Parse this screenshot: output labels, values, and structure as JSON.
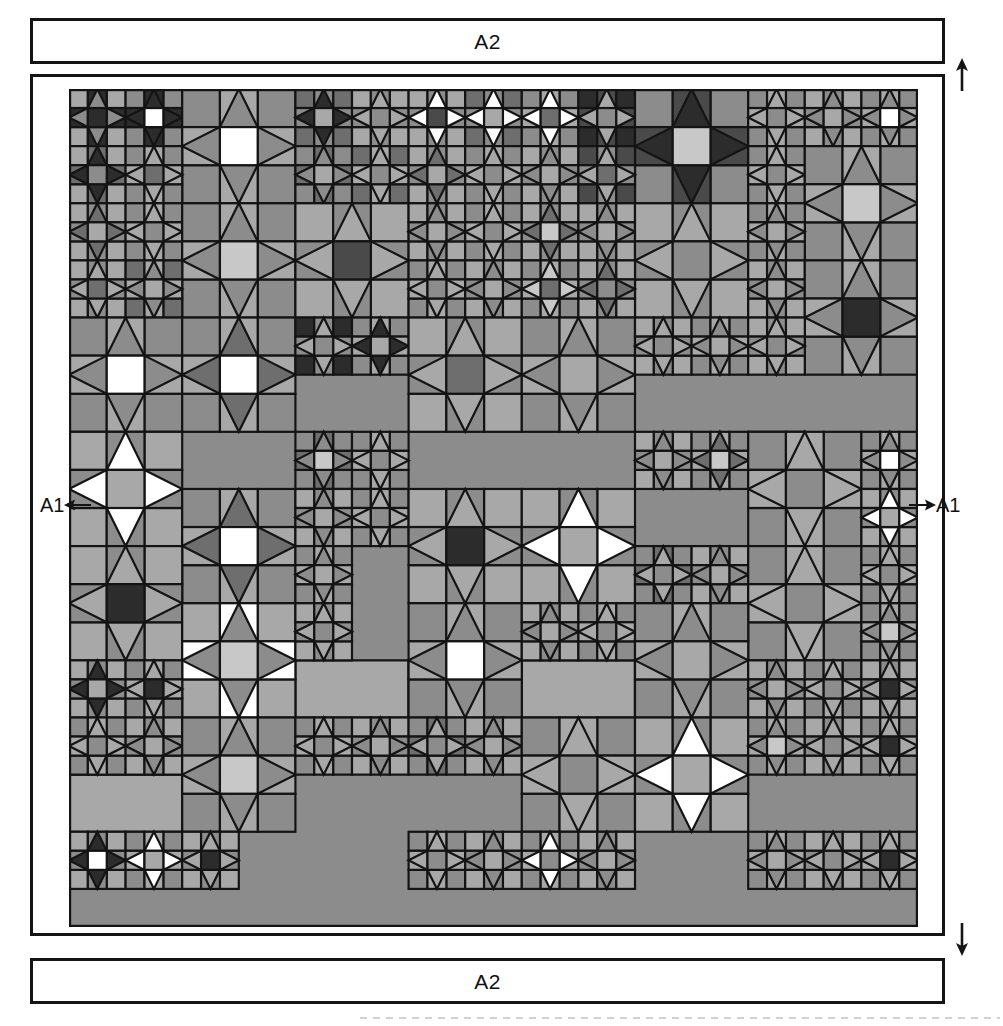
{
  "page": {
    "width": 1003,
    "height": 1026,
    "background": "#ffffff",
    "line_color": "#141414"
  },
  "border_strips": {
    "top": {
      "label": "A2"
    },
    "bottom": {
      "label": "A2"
    }
  },
  "side_markers": {
    "left": {
      "label": "A1",
      "arrow": "arrow-left-icon",
      "direction": "left"
    },
    "right": {
      "label": "A1",
      "arrow": "arrow-right-icon",
      "direction": "right"
    }
  },
  "direction_arrows": {
    "top": {
      "icon": "arrow-up-icon",
      "direction": "up"
    },
    "bottom": {
      "icon": "arrow-down-icon",
      "direction": "down"
    }
  },
  "palette": {
    "white": "#ffffff",
    "light": "#c8c8c8",
    "mid_light": "#a8a8a8",
    "mid": "#8c8c8c",
    "mid_dark": "#6e6e6e",
    "dark": "#4a4a4a",
    "darkest": "#2c2c2c",
    "outline": "#141414"
  },
  "quilt": {
    "name": "sawtooth-star-sampler",
    "unit": 19,
    "cols": 45,
    "rows": 44,
    "stroke_width": 2.2,
    "blocks": [
      {
        "x": 0,
        "y": 0,
        "n": 3,
        "center": "darkest",
        "star": "mid",
        "bg": "darkest",
        "corner": "mid_light"
      },
      {
        "x": 3,
        "y": 0,
        "n": 3,
        "center": "white",
        "star": "darkest",
        "bg": "darkest",
        "corner": "mid"
      },
      {
        "x": 6,
        "y": 0,
        "n": 6,
        "center": "white",
        "star": "mid",
        "bg": "mid_light",
        "corner": "mid"
      },
      {
        "x": 12,
        "y": 0,
        "n": 3,
        "center": "mid_light",
        "star": "darkest",
        "bg": "mid",
        "corner": "mid_dark"
      },
      {
        "x": 15,
        "y": 0,
        "n": 3,
        "center": "mid",
        "star": "mid_light",
        "bg": "mid",
        "corner": "mid_light"
      },
      {
        "x": 18,
        "y": 0,
        "n": 3,
        "center": "dark",
        "star": "white",
        "bg": "mid",
        "corner": "mid_light"
      },
      {
        "x": 21,
        "y": 0,
        "n": 3,
        "center": "mid_light",
        "star": "white",
        "bg": "mid",
        "corner": "mid_dark"
      },
      {
        "x": 24,
        "y": 0,
        "n": 3,
        "center": "mid_dark",
        "star": "white",
        "bg": "mid_light",
        "corner": "mid"
      },
      {
        "x": 27,
        "y": 0,
        "n": 3,
        "center": "mid",
        "star": "mid_light",
        "bg": "dark",
        "corner": "darkest"
      },
      {
        "x": 30,
        "y": 0,
        "n": 6,
        "center": "light",
        "star": "darkest",
        "bg": "dark",
        "corner": "mid"
      },
      {
        "x": 36,
        "y": 0,
        "n": 3,
        "center": "mid",
        "star": "mid_light",
        "bg": "mid_light",
        "corner": "mid"
      },
      {
        "x": 39,
        "y": 0,
        "n": 3,
        "center": "mid_light",
        "star": "mid",
        "bg": "mid",
        "corner": "mid_light"
      },
      {
        "x": 42,
        "y": 0,
        "n": 3,
        "center": "white",
        "star": "mid",
        "bg": "mid_light",
        "corner": "mid"
      },
      {
        "x": 0,
        "y": 3,
        "n": 3,
        "center": "mid",
        "star": "darkest",
        "bg": "mid_dark",
        "corner": "mid_light"
      },
      {
        "x": 3,
        "y": 3,
        "n": 3,
        "center": "mid_dark",
        "star": "mid_light",
        "bg": "mid_light",
        "corner": "mid"
      },
      {
        "x": 12,
        "y": 3,
        "n": 3,
        "center": "mid_light",
        "star": "mid",
        "bg": "mid_dark",
        "corner": "mid"
      },
      {
        "x": 15,
        "y": 3,
        "n": 3,
        "center": "mid",
        "star": "mid_light",
        "bg": "mid_light",
        "corner": "mid_dark"
      },
      {
        "x": 18,
        "y": 3,
        "n": 3,
        "center": "mid_light",
        "star": "mid_dark",
        "bg": "mid",
        "corner": "mid_light"
      },
      {
        "x": 21,
        "y": 3,
        "n": 3,
        "center": "mid",
        "star": "mid_light",
        "bg": "mid_light",
        "corner": "mid"
      },
      {
        "x": 24,
        "y": 3,
        "n": 3,
        "center": "mid_light",
        "star": "mid",
        "bg": "mid",
        "corner": "mid_light"
      },
      {
        "x": 27,
        "y": 3,
        "n": 3,
        "center": "mid_dark",
        "star": "mid_light",
        "bg": "mid",
        "corner": "dark"
      },
      {
        "x": 36,
        "y": 3,
        "n": 3,
        "center": "mid",
        "star": "mid_light",
        "bg": "mid_light",
        "corner": "mid"
      },
      {
        "x": 39,
        "y": 3,
        "n": 6,
        "center": "light",
        "star": "mid",
        "bg": "mid_light",
        "corner": "mid"
      },
      {
        "x": 0,
        "y": 6,
        "n": 3,
        "center": "mid_light",
        "star": "mid_dark",
        "bg": "mid",
        "corner": "mid_light"
      },
      {
        "x": 3,
        "y": 6,
        "n": 3,
        "center": "mid",
        "star": "mid_light",
        "bg": "mid_light",
        "corner": "mid"
      },
      {
        "x": 6,
        "y": 6,
        "n": 6,
        "center": "light",
        "star": "mid",
        "bg": "mid_light",
        "corner": "mid"
      },
      {
        "x": 12,
        "y": 6,
        "n": 6,
        "center": "dark",
        "star": "mid_light",
        "bg": "mid",
        "corner": "mid_light"
      },
      {
        "x": 18,
        "y": 6,
        "n": 3,
        "center": "mid_light",
        "star": "mid",
        "bg": "mid",
        "corner": "mid_light"
      },
      {
        "x": 21,
        "y": 6,
        "n": 3,
        "center": "mid",
        "star": "mid_light",
        "bg": "mid_light",
        "corner": "mid"
      },
      {
        "x": 24,
        "y": 6,
        "n": 3,
        "center": "light",
        "star": "mid_dark",
        "bg": "mid",
        "corner": "mid_light"
      },
      {
        "x": 27,
        "y": 6,
        "n": 3,
        "center": "mid_light",
        "star": "mid",
        "bg": "mid",
        "corner": "mid_light"
      },
      {
        "x": 30,
        "y": 6,
        "n": 6,
        "center": "mid",
        "star": "mid_light",
        "bg": "mid",
        "corner": "mid_light"
      },
      {
        "x": 36,
        "y": 6,
        "n": 3,
        "center": "mid_light",
        "star": "mid",
        "bg": "mid_light",
        "corner": "mid"
      },
      {
        "x": 0,
        "y": 9,
        "n": 3,
        "center": "mid_dark",
        "star": "mid_light",
        "bg": "mid",
        "corner": "mid_light"
      },
      {
        "x": 3,
        "y": 9,
        "n": 3,
        "center": "mid_light",
        "star": "mid",
        "bg": "mid_light",
        "corner": "mid_dark"
      },
      {
        "x": 18,
        "y": 9,
        "n": 3,
        "center": "mid",
        "star": "mid_light",
        "bg": "mid_light",
        "corner": "mid"
      },
      {
        "x": 21,
        "y": 9,
        "n": 3,
        "center": "mid_light",
        "star": "mid",
        "bg": "mid",
        "corner": "mid_light"
      },
      {
        "x": 24,
        "y": 9,
        "n": 3,
        "center": "mid_dark",
        "star": "light",
        "bg": "mid_light",
        "corner": "mid"
      },
      {
        "x": 27,
        "y": 9,
        "n": 3,
        "center": "mid",
        "star": "mid_dark",
        "bg": "mid",
        "corner": "mid_light"
      },
      {
        "x": 36,
        "y": 9,
        "n": 3,
        "center": "mid_light",
        "star": "mid",
        "bg": "mid",
        "corner": "mid_light"
      },
      {
        "x": 39,
        "y": 9,
        "n": 6,
        "center": "darkest",
        "star": "mid",
        "bg": "mid_light",
        "corner": "mid"
      },
      {
        "x": 0,
        "y": 12,
        "n": 6,
        "center": "white",
        "star": "mid",
        "bg": "mid_light",
        "corner": "mid"
      },
      {
        "x": 6,
        "y": 12,
        "n": 6,
        "center": "white",
        "star": "mid_dark",
        "bg": "mid_light",
        "corner": "mid"
      },
      {
        "x": 12,
        "y": 12,
        "n": 3,
        "center": "mid",
        "star": "mid_light",
        "bg": "mid",
        "corner": "darkest"
      },
      {
        "x": 15,
        "y": 12,
        "n": 3,
        "center": "mid_light",
        "star": "darkest",
        "bg": "mid_light",
        "corner": "mid"
      },
      {
        "x": 18,
        "y": 12,
        "n": 6,
        "center": "mid_dark",
        "star": "mid_light",
        "bg": "mid",
        "corner": "mid_light"
      },
      {
        "x": 24,
        "y": 12,
        "n": 6,
        "center": "mid_light",
        "star": "mid",
        "bg": "mid_light",
        "corner": "mid"
      },
      {
        "x": 30,
        "y": 12,
        "n": 3,
        "center": "mid",
        "star": "mid_light",
        "bg": "mid",
        "corner": "mid_light"
      },
      {
        "x": 33,
        "y": 12,
        "n": 3,
        "center": "mid_light",
        "star": "mid",
        "bg": "mid_light",
        "corner": "mid"
      },
      {
        "x": 36,
        "y": 12,
        "n": 3,
        "center": "mid",
        "star": "mid_light",
        "bg": "mid",
        "corner": "mid_light"
      },
      {
        "x": 0,
        "y": 18,
        "n": 6,
        "center": "mid_light",
        "star": "white",
        "bg": "mid",
        "corner": "mid_light"
      },
      {
        "x": 12,
        "y": 18,
        "n": 3,
        "center": "light",
        "star": "mid",
        "bg": "mid_dark",
        "corner": "mid"
      },
      {
        "x": 15,
        "y": 18,
        "n": 3,
        "center": "mid",
        "star": "mid_light",
        "bg": "mid_light",
        "corner": "mid"
      },
      {
        "x": 30,
        "y": 18,
        "n": 3,
        "center": "mid_light",
        "star": "mid",
        "bg": "mid",
        "corner": "mid_light"
      },
      {
        "x": 33,
        "y": 18,
        "n": 3,
        "center": "light",
        "star": "mid_dark",
        "bg": "mid_light",
        "corner": "mid"
      },
      {
        "x": 36,
        "y": 18,
        "n": 6,
        "center": "mid",
        "star": "mid_light",
        "bg": "mid_light",
        "corner": "mid"
      },
      {
        "x": 42,
        "y": 18,
        "n": 3,
        "center": "white",
        "star": "mid",
        "bg": "mid_light",
        "corner": "mid"
      },
      {
        "x": 6,
        "y": 21,
        "n": 6,
        "center": "white",
        "star": "mid_dark",
        "bg": "mid_light",
        "corner": "mid"
      },
      {
        "x": 12,
        "y": 21,
        "n": 3,
        "center": "mid_light",
        "star": "mid",
        "bg": "mid",
        "corner": "mid_light"
      },
      {
        "x": 15,
        "y": 21,
        "n": 3,
        "center": "mid",
        "star": "mid_light",
        "bg": "mid_light",
        "corner": "mid"
      },
      {
        "x": 18,
        "y": 21,
        "n": 6,
        "center": "darkest",
        "star": "mid_light",
        "bg": "mid",
        "corner": "mid_light"
      },
      {
        "x": 24,
        "y": 21,
        "n": 6,
        "center": "mid_light",
        "star": "white",
        "bg": "mid",
        "corner": "mid_light"
      },
      {
        "x": 42,
        "y": 21,
        "n": 3,
        "center": "mid_light",
        "star": "white",
        "bg": "mid",
        "corner": "mid_light"
      },
      {
        "x": 0,
        "y": 24,
        "n": 6,
        "center": "darkest",
        "star": "mid_light",
        "bg": "mid",
        "corner": "mid_light"
      },
      {
        "x": 12,
        "y": 24,
        "n": 3,
        "center": "mid_light",
        "star": "mid",
        "bg": "mid_light",
        "corner": "mid"
      },
      {
        "x": 30,
        "y": 24,
        "n": 3,
        "center": "mid",
        "star": "mid_light",
        "bg": "mid_dark",
        "corner": "mid"
      },
      {
        "x": 33,
        "y": 24,
        "n": 3,
        "center": "mid_light",
        "star": "mid",
        "bg": "mid",
        "corner": "mid_light"
      },
      {
        "x": 36,
        "y": 24,
        "n": 6,
        "center": "mid",
        "star": "mid_light",
        "bg": "mid_light",
        "corner": "mid"
      },
      {
        "x": 42,
        "y": 24,
        "n": 3,
        "center": "mid",
        "star": "mid_light",
        "bg": "mid_light",
        "corner": "mid"
      },
      {
        "x": 6,
        "y": 27,
        "n": 6,
        "center": "light",
        "star": "mid",
        "bg": "white",
        "corner": "mid_light"
      },
      {
        "x": 12,
        "y": 27,
        "n": 3,
        "center": "mid",
        "star": "mid_light",
        "bg": "mid",
        "corner": "mid_light"
      },
      {
        "x": 18,
        "y": 27,
        "n": 6,
        "center": "white",
        "star": "mid",
        "bg": "mid_light",
        "corner": "mid"
      },
      {
        "x": 24,
        "y": 27,
        "n": 3,
        "center": "mid_light",
        "star": "mid",
        "bg": "mid",
        "corner": "mid_light"
      },
      {
        "x": 27,
        "y": 27,
        "n": 3,
        "center": "mid",
        "star": "mid_light",
        "bg": "mid_light",
        "corner": "mid"
      },
      {
        "x": 30,
        "y": 27,
        "n": 6,
        "center": "mid_light",
        "star": "mid",
        "bg": "mid_light",
        "corner": "mid"
      },
      {
        "x": 42,
        "y": 27,
        "n": 3,
        "center": "light",
        "star": "mid",
        "bg": "mid_light",
        "corner": "mid"
      },
      {
        "x": 0,
        "y": 30,
        "n": 3,
        "center": "mid_light",
        "star": "darkest",
        "bg": "mid",
        "corner": "mid_light"
      },
      {
        "x": 3,
        "y": 30,
        "n": 3,
        "center": "darkest",
        "star": "mid_light",
        "bg": "mid_light",
        "corner": "mid"
      },
      {
        "x": 36,
        "y": 30,
        "n": 3,
        "center": "mid_light",
        "star": "mid",
        "bg": "mid",
        "corner": "mid_light"
      },
      {
        "x": 39,
        "y": 30,
        "n": 3,
        "center": "mid",
        "star": "mid_light",
        "bg": "mid_light",
        "corner": "mid"
      },
      {
        "x": 42,
        "y": 30,
        "n": 3,
        "center": "darkest",
        "star": "mid_light",
        "bg": "mid",
        "corner": "mid_light"
      },
      {
        "x": 0,
        "y": 33,
        "n": 3,
        "center": "mid",
        "star": "mid_light",
        "bg": "mid_light",
        "corner": "mid"
      },
      {
        "x": 3,
        "y": 33,
        "n": 3,
        "center": "mid_light",
        "star": "mid",
        "bg": "mid",
        "corner": "mid_light"
      },
      {
        "x": 6,
        "y": 33,
        "n": 6,
        "center": "light",
        "star": "mid",
        "bg": "mid_light",
        "corner": "mid"
      },
      {
        "x": 12,
        "y": 33,
        "n": 3,
        "center": "mid",
        "star": "mid_light",
        "bg": "mid_light",
        "corner": "mid"
      },
      {
        "x": 15,
        "y": 33,
        "n": 3,
        "center": "mid_light",
        "star": "mid",
        "bg": "mid",
        "corner": "mid_light"
      },
      {
        "x": 18,
        "y": 33,
        "n": 3,
        "center": "mid",
        "star": "mid_light",
        "bg": "mid_dark",
        "corner": "mid"
      },
      {
        "x": 21,
        "y": 33,
        "n": 3,
        "center": "mid_light",
        "star": "mid",
        "bg": "mid",
        "corner": "mid_light"
      },
      {
        "x": 24,
        "y": 33,
        "n": 6,
        "center": "mid",
        "star": "mid_light",
        "bg": "mid_light",
        "corner": "mid"
      },
      {
        "x": 30,
        "y": 33,
        "n": 6,
        "center": "mid_light",
        "star": "white",
        "bg": "mid",
        "corner": "mid_light"
      },
      {
        "x": 36,
        "y": 33,
        "n": 3,
        "center": "light",
        "star": "mid",
        "bg": "mid_light",
        "corner": "mid"
      },
      {
        "x": 39,
        "y": 33,
        "n": 3,
        "center": "mid",
        "star": "mid_light",
        "bg": "mid",
        "corner": "mid_light"
      },
      {
        "x": 42,
        "y": 33,
        "n": 3,
        "center": "darkest",
        "star": "mid_light",
        "bg": "mid_light",
        "corner": "mid"
      },
      {
        "x": 0,
        "y": 39,
        "n": 3,
        "center": "white",
        "star": "darkest",
        "bg": "mid",
        "corner": "mid_light"
      },
      {
        "x": 3,
        "y": 39,
        "n": 3,
        "center": "mid_light",
        "star": "white",
        "bg": "mid_light",
        "corner": "mid"
      },
      {
        "x": 6,
        "y": 39,
        "n": 3,
        "center": "darkest",
        "star": "mid_light",
        "bg": "mid",
        "corner": "mid_light"
      },
      {
        "x": 18,
        "y": 39,
        "n": 3,
        "center": "mid",
        "star": "mid_light",
        "bg": "mid_light",
        "corner": "mid"
      },
      {
        "x": 21,
        "y": 39,
        "n": 3,
        "center": "mid_light",
        "star": "mid",
        "bg": "mid",
        "corner": "mid_light"
      },
      {
        "x": 24,
        "y": 39,
        "n": 3,
        "center": "mid",
        "star": "white",
        "bg": "mid_light",
        "corner": "mid"
      },
      {
        "x": 27,
        "y": 39,
        "n": 3,
        "center": "mid_light",
        "star": "mid",
        "bg": "mid",
        "corner": "mid_light"
      },
      {
        "x": 36,
        "y": 39,
        "n": 3,
        "center": "mid_light",
        "star": "mid",
        "bg": "mid_light",
        "corner": "mid"
      },
      {
        "x": 39,
        "y": 39,
        "n": 3,
        "center": "mid",
        "star": "mid_light",
        "bg": "mid",
        "corner": "mid_light"
      },
      {
        "x": 42,
        "y": 39,
        "n": 3,
        "center": "darkest",
        "star": "mid_light",
        "bg": "mid_light",
        "corner": "mid"
      }
    ],
    "filler": [
      {
        "x": 36,
        "y": 18,
        "w": 3,
        "h": 3,
        "color": "mid"
      },
      {
        "x": 12,
        "y": 30,
        "w": 6,
        "h": 3,
        "color": "mid_light"
      },
      {
        "x": 18,
        "y": 30,
        "w": 6,
        "h": 3,
        "color": "mid"
      },
      {
        "x": 24,
        "y": 30,
        "w": 6,
        "h": 3,
        "color": "mid_light"
      },
      {
        "x": 30,
        "y": 30,
        "w": 6,
        "h": 3,
        "color": "mid"
      },
      {
        "x": 0,
        "y": 36,
        "w": 6,
        "h": 3,
        "color": "mid_light"
      },
      {
        "x": 6,
        "y": 39,
        "w": 0,
        "h": 0,
        "color": "mid"
      }
    ]
  }
}
